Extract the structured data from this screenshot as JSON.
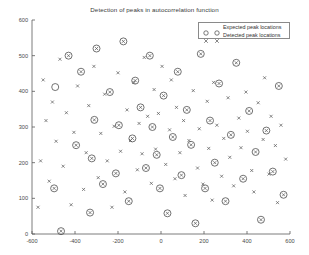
{
  "chart_data": {
    "type": "scatter",
    "title": "Detection of peaks in autocorrelation function",
    "xlabel": "",
    "ylabel": "",
    "xlim": [
      -600,
      600
    ],
    "ylim": [
      0,
      600
    ],
    "xticks": [
      -600,
      -400,
      -200,
      0,
      200,
      400,
      600
    ],
    "xticklabels": [
      "-600",
      "-400",
      "-200",
      "0",
      "200",
      "400",
      "600"
    ],
    "yticks": [
      0,
      100,
      200,
      300,
      400,
      500,
      600
    ],
    "yticklabels": [
      "0",
      "100",
      "200",
      "300",
      "400",
      "500",
      "600"
    ],
    "grid": false,
    "legend_position": "upper right",
    "series": [
      {
        "name": "Expected peak locations",
        "marker": "o",
        "marker_size": 7,
        "color": "#444444",
        "points": [
          [
            -497,
            128
          ],
          [
            -492,
            412
          ],
          [
            -465,
            8
          ],
          [
            -430,
            500
          ],
          [
            -395,
            249
          ],
          [
            -372,
            455
          ],
          [
            -330,
            60
          ],
          [
            -322,
            212
          ],
          [
            -310,
            320
          ],
          [
            -300,
            520
          ],
          [
            -270,
            140
          ],
          [
            -238,
            398
          ],
          [
            -210,
            170
          ],
          [
            -196,
            305
          ],
          [
            -175,
            540
          ],
          [
            -150,
            92
          ],
          [
            -133,
            268
          ],
          [
            -120,
            430
          ],
          [
            -95,
            355
          ],
          [
            -70,
            185
          ],
          [
            -52,
            500
          ],
          [
            -40,
            300
          ],
          [
            -20,
            222
          ],
          [
            -5,
            128
          ],
          [
            12,
            388
          ],
          [
            30,
            58
          ],
          [
            55,
            272
          ],
          [
            78,
            455
          ],
          [
            95,
            165
          ],
          [
            120,
            348
          ],
          [
            140,
            250
          ],
          [
            160,
            30
          ],
          [
            185,
            505
          ],
          [
            205,
            128
          ],
          [
            228,
            318
          ],
          [
            250,
            200
          ],
          [
            270,
            422
          ],
          [
            300,
            92
          ],
          [
            325,
            278
          ],
          [
            350,
            480
          ],
          [
            382,
            155
          ],
          [
            410,
            345
          ],
          [
            440,
            230
          ],
          [
            465,
            40
          ],
          [
            490,
            290
          ],
          [
            520,
            175
          ],
          [
            548,
            415
          ],
          [
            570,
            110
          ]
        ]
      },
      {
        "name": "Detected peak locations",
        "marker": "x",
        "marker_size": 3,
        "color": "#555555",
        "points": [
          [
            -572,
            75
          ],
          [
            -560,
            205
          ],
          [
            -548,
            432
          ],
          [
            -535,
            318
          ],
          [
            -520,
            148
          ],
          [
            -505,
            370
          ],
          [
            -497,
            128
          ],
          [
            -488,
            260
          ],
          [
            -470,
            490
          ],
          [
            -465,
            8
          ],
          [
            -455,
            190
          ],
          [
            -440,
            340
          ],
          [
            -430,
            500
          ],
          [
            -418,
            82
          ],
          [
            -405,
            285
          ],
          [
            -395,
            249
          ],
          [
            -388,
            415
          ],
          [
            -372,
            455
          ],
          [
            -360,
            125
          ],
          [
            -348,
            228
          ],
          [
            -336,
            360
          ],
          [
            -330,
            60
          ],
          [
            -322,
            212
          ],
          [
            -312,
            470
          ],
          [
            -310,
            320
          ],
          [
            -300,
            520
          ],
          [
            -292,
            158
          ],
          [
            -280,
            282
          ],
          [
            -270,
            140
          ],
          [
            -262,
            392
          ],
          [
            -250,
            205
          ],
          [
            -238,
            398
          ],
          [
            -228,
            75
          ],
          [
            -218,
            302
          ],
          [
            -210,
            170
          ],
          [
            -200,
            452
          ],
          [
            -196,
            305
          ],
          [
            -188,
            232
          ],
          [
            -175,
            540
          ],
          [
            -168,
            118
          ],
          [
            -158,
            348
          ],
          [
            -150,
            92
          ],
          [
            -142,
            262
          ],
          [
            -133,
            268
          ],
          [
            -126,
            425
          ],
          [
            -120,
            430
          ],
          [
            -110,
            180
          ],
          [
            -102,
            310
          ],
          [
            -95,
            355
          ],
          [
            -88,
            225
          ],
          [
            -78,
            495
          ],
          [
            -70,
            185
          ],
          [
            -62,
            330
          ],
          [
            -52,
            500
          ],
          [
            -45,
            142
          ],
          [
            -40,
            300
          ],
          [
            -32,
            405
          ],
          [
            -25,
            238
          ],
          [
            -20,
            222
          ],
          [
            -12,
            338
          ],
          [
            -5,
            128
          ],
          [
            5,
            470
          ],
          [
            12,
            388
          ],
          [
            22,
            195
          ],
          [
            30,
            58
          ],
          [
            40,
            292
          ],
          [
            48,
            432
          ],
          [
            55,
            272
          ],
          [
            65,
            155
          ],
          [
            72,
            355
          ],
          [
            78,
            455
          ],
          [
            88,
            228
          ],
          [
            95,
            165
          ],
          [
            105,
            318
          ],
          [
            112,
            108
          ],
          [
            120,
            348
          ],
          [
            130,
            262
          ],
          [
            140,
            250
          ],
          [
            150,
            402
          ],
          [
            160,
            30
          ],
          [
            170,
            185
          ],
          [
            178,
            295
          ],
          [
            185,
            505
          ],
          [
            195,
            140
          ],
          [
            205,
            128
          ],
          [
            215,
            372
          ],
          [
            222,
            240
          ],
          [
            228,
            318
          ],
          [
            238,
            95
          ],
          [
            245,
            425
          ],
          [
            250,
            200
          ],
          [
            260,
            305
          ],
          [
            270,
            422
          ],
          [
            282,
            162
          ],
          [
            292,
            268
          ],
          [
            300,
            92
          ],
          [
            312,
            382
          ],
          [
            320,
            215
          ],
          [
            325,
            278
          ],
          [
            338,
            135
          ],
          [
            350,
            480
          ],
          [
            362,
            325
          ],
          [
            372,
            242
          ],
          [
            382,
            155
          ],
          [
            395,
            398
          ],
          [
            402,
            288
          ],
          [
            410,
            345
          ],
          [
            422,
            178
          ],
          [
            432,
            118
          ],
          [
            440,
            230
          ],
          [
            452,
            368
          ],
          [
            465,
            40
          ],
          [
            475,
            265
          ],
          [
            482,
            438
          ],
          [
            490,
            290
          ],
          [
            502,
            168
          ],
          [
            512,
            330
          ],
          [
            520,
            175
          ],
          [
            532,
            248
          ],
          [
            542,
            88
          ],
          [
            548,
            415
          ],
          [
            558,
            305
          ],
          [
            570,
            110
          ],
          [
            580,
            210
          ]
        ]
      }
    ]
  },
  "legend": {
    "items": [
      {
        "label": "Expected peak locations",
        "marker": "circle-marker"
      },
      {
        "label": "Detected peak locations",
        "marker": "x-marker"
      }
    ]
  }
}
